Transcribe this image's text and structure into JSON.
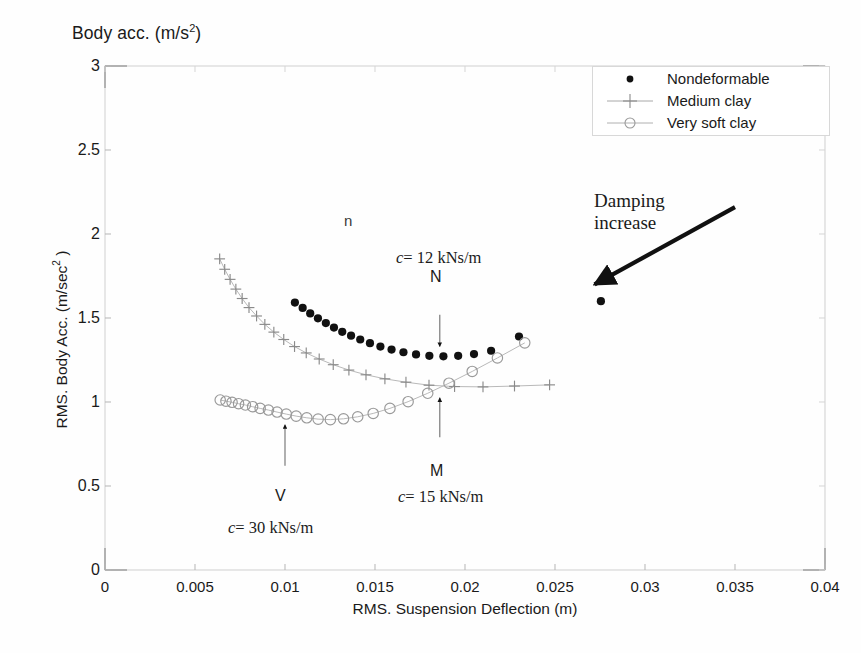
{
  "figure": {
    "top_cropped_text": "",
    "bottom_cropped_caption": "",
    "top_label": "Body acc. (m/s",
    "top_label_sup": "2",
    "top_label_tail": ")"
  },
  "axes": {
    "y_title_main": "RMS. Body Acc. (m/sec",
    "y_title_sup": "2",
    "y_title_tail": " )",
    "x_title": "RMS. Suspension Deflection (m)",
    "y_ticks": [
      "0",
      "0.5",
      "1",
      "1.5",
      "2",
      "2.5",
      "3"
    ],
    "x_ticks": [
      "0",
      "0.005",
      "0.01",
      "0.015",
      "0.02",
      "0.025",
      "0.03",
      "0.035",
      "0.04"
    ]
  },
  "legend": {
    "items": [
      {
        "label": "Nondeformable",
        "marker": "filled-dot",
        "color": "#111111"
      },
      {
        "label": "Medium clay",
        "marker": "plus-line",
        "color": "#7a7a7a"
      },
      {
        "label": "Very soft clay",
        "marker": "circle-line",
        "color": "#8c8c8c"
      }
    ]
  },
  "annotations": {
    "damping_line1": "Damping",
    "damping_line2": "increase",
    "n_point_label": "N",
    "n_point_value": "c",
    "n_point_value_rest": "= 12 kNs/m",
    "m_point_label": "M",
    "m_point_value": "c",
    "m_point_value_rest": "= 15 kNs/m",
    "v_point_label": "V",
    "v_point_value": "c",
    "v_point_value_rest": "= 30 kNs/m",
    "stray_n": "n"
  },
  "chart_data": {
    "type": "scatter",
    "xlabel": "RMS. Suspension Deflection (m)",
    "ylabel": "RMS. Body Acc. (m/sec^2)",
    "xlim": [
      0,
      0.04
    ],
    "ylim": [
      0,
      3
    ],
    "xticks": [
      0,
      0.005,
      0.01,
      0.015,
      0.02,
      0.025,
      0.03,
      0.035,
      0.04
    ],
    "yticks": [
      0,
      0.5,
      1,
      1.5,
      2,
      2.5,
      3
    ],
    "grid": false,
    "legend_position": "top-right",
    "series": [
      {
        "name": "Nondeformable",
        "marker": "filled-dot",
        "line": false,
        "color": "#111111",
        "points": [
          [
            0.01055,
            1.592
          ],
          [
            0.01098,
            1.56
          ],
          [
            0.0114,
            1.527
          ],
          [
            0.01183,
            1.498
          ],
          [
            0.01227,
            1.47
          ],
          [
            0.01272,
            1.443
          ],
          [
            0.01318,
            1.418
          ],
          [
            0.01367,
            1.395
          ],
          [
            0.01418,
            1.372
          ],
          [
            0.01472,
            1.35
          ],
          [
            0.0153,
            1.33
          ],
          [
            0.01592,
            1.312
          ],
          [
            0.01658,
            1.296
          ],
          [
            0.01728,
            1.283
          ],
          [
            0.01802,
            1.275
          ],
          [
            0.0188,
            1.272
          ],
          [
            0.01962,
            1.275
          ],
          [
            0.0205,
            1.285
          ],
          [
            0.02145,
            1.305
          ],
          [
            0.023,
            1.39
          ]
        ]
      },
      {
        "name": "Medium clay",
        "marker": "plus",
        "line": true,
        "color": "#8a8a8a",
        "points": [
          [
            0.00637,
            1.852
          ],
          [
            0.00665,
            1.79
          ],
          [
            0.00695,
            1.73
          ],
          [
            0.00727,
            1.672
          ],
          [
            0.00762,
            1.616
          ],
          [
            0.008,
            1.562
          ],
          [
            0.00842,
            1.512
          ],
          [
            0.00888,
            1.462
          ],
          [
            0.00938,
            1.416
          ],
          [
            0.00993,
            1.372
          ],
          [
            0.01053,
            1.33
          ],
          [
            0.01118,
            1.292
          ],
          [
            0.0119,
            1.256
          ],
          [
            0.01268,
            1.222
          ],
          [
            0.01355,
            1.19
          ],
          [
            0.0145,
            1.162
          ],
          [
            0.01555,
            1.138
          ],
          [
            0.01672,
            1.118
          ],
          [
            0.018,
            1.1
          ],
          [
            0.01942,
            1.092
          ],
          [
            0.021,
            1.09
          ],
          [
            0.02275,
            1.095
          ],
          [
            0.0247,
            1.102
          ]
        ]
      },
      {
        "name": "Very soft clay",
        "marker": "circle",
        "line": true,
        "color": "#999999",
        "points": [
          [
            0.0064,
            1.012
          ],
          [
            0.00672,
            1.005
          ],
          [
            0.00706,
            0.998
          ],
          [
            0.00742,
            0.99
          ],
          [
            0.0078,
            0.982
          ],
          [
            0.0082,
            0.972
          ],
          [
            0.00862,
            0.962
          ],
          [
            0.00908,
            0.952
          ],
          [
            0.00956,
            0.94
          ],
          [
            0.01007,
            0.928
          ],
          [
            0.01062,
            0.916
          ],
          [
            0.01121,
            0.906
          ],
          [
            0.01184,
            0.898
          ],
          [
            0.01252,
            0.895
          ],
          [
            0.01325,
            0.9
          ],
          [
            0.01404,
            0.912
          ],
          [
            0.0149,
            0.932
          ],
          [
            0.01583,
            0.962
          ],
          [
            0.01684,
            1.002
          ],
          [
            0.01793,
            1.052
          ],
          [
            0.01911,
            1.112
          ],
          [
            0.0204,
            1.182
          ],
          [
            0.0218,
            1.262
          ],
          [
            0.02332,
            1.352
          ]
        ]
      },
      {
        "name": "Nondeformable high-damping outlier",
        "marker": "filled-dot",
        "line": false,
        "color": "#111111",
        "points": [
          [
            0.02755,
            1.6
          ]
        ]
      }
    ],
    "annotations": [
      {
        "text": "c = 12 kNs/m",
        "label": "N",
        "arrow": "down",
        "at": [
          0.0186,
          1.285
        ]
      },
      {
        "text": "c = 15 kNs/m",
        "label": "M",
        "arrow": "up",
        "at": [
          0.0186,
          1.062
        ]
      },
      {
        "text": "c = 30 kNs/m",
        "label": "V",
        "arrow": "up",
        "at": [
          0.01,
          0.905
        ]
      },
      {
        "text": "Damping increase",
        "arrow": "down-left",
        "from": [
          0.035,
          2.16
        ],
        "to": [
          0.027,
          1.69
        ]
      }
    ]
  }
}
